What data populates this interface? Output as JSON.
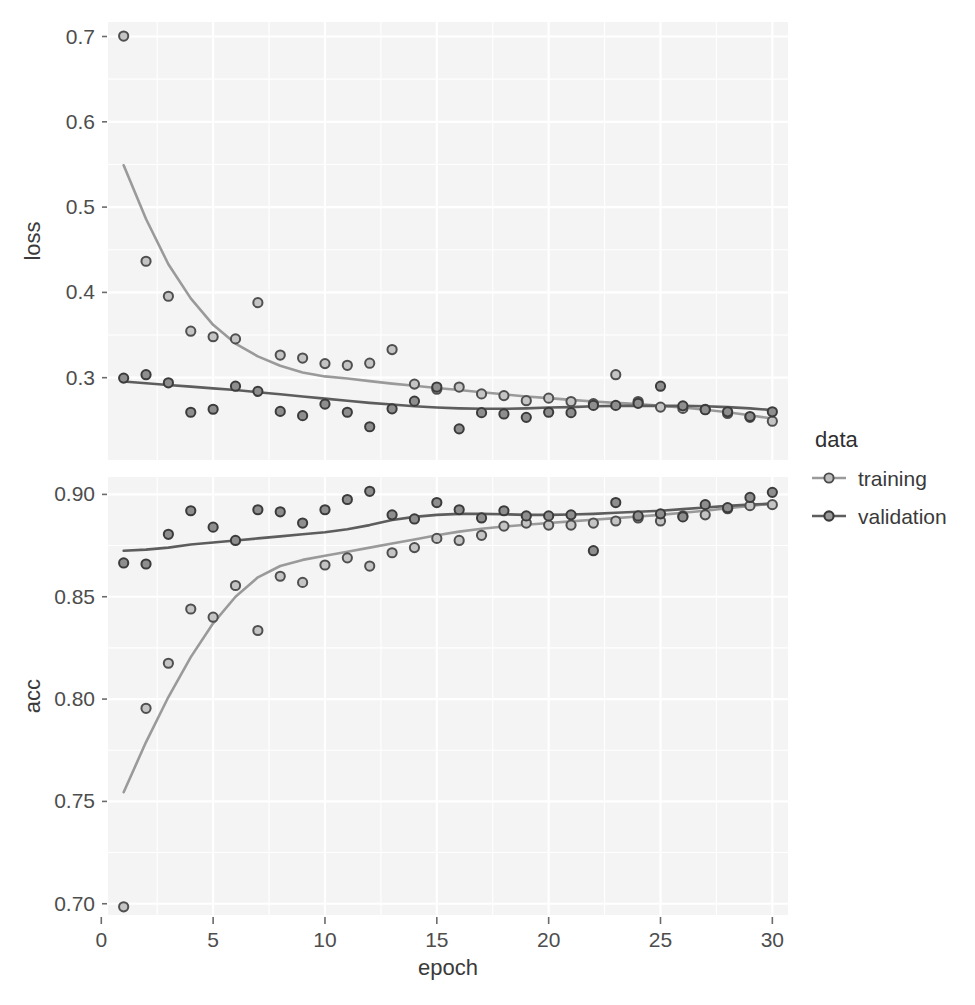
{
  "figure": {
    "background": "#ffffff",
    "panel_background": "#f4f4f4",
    "grid_color": "#ffffff",
    "width": 975,
    "height": 1005
  },
  "axes": {
    "x_title": "epoch",
    "x_ticks": [
      "0",
      "5",
      "10",
      "15",
      "20",
      "25",
      "30"
    ],
    "panels": [
      {
        "strip_label": "loss",
        "y_ticks": [
          "0.3",
          "0.4",
          "0.5",
          "0.6",
          "0.7"
        ]
      },
      {
        "strip_label": "acc",
        "y_ticks": [
          "0.70",
          "0.75",
          "0.80",
          "0.85",
          "0.90"
        ]
      }
    ]
  },
  "legend": {
    "title": "data",
    "position": "right",
    "items": [
      {
        "label": "training",
        "color": "#9a9a9a",
        "key_icon": "line-point-key-icon"
      },
      {
        "label": "validation",
        "color": "#5d5d5d",
        "key_icon": "line-point-key-icon"
      }
    ]
  },
  "chart_data": [
    {
      "type": "scatter",
      "id": "loss-panel",
      "title": "",
      "xlabel": "epoch",
      "ylabel": "loss",
      "xlim": [
        0.3,
        30.7
      ],
      "ylim": [
        0.2035,
        0.717
      ],
      "xticks": [
        0,
        5,
        10,
        15,
        20,
        25,
        30
      ],
      "yticks": [
        0.3,
        0.4,
        0.5,
        0.6,
        0.7
      ],
      "grid": true,
      "legend_position": "right",
      "x": [
        1,
        2,
        3,
        4,
        5,
        6,
        7,
        8,
        9,
        10,
        11,
        12,
        13,
        14,
        15,
        16,
        17,
        18,
        19,
        20,
        21,
        22,
        23,
        24,
        25,
        26,
        27,
        28,
        29,
        30
      ],
      "series": [
        {
          "name": "training",
          "color": "#9a9a9a",
          "has_smooth_line": true,
          "values": [
            0.7005,
            0.4365,
            0.3955,
            0.3545,
            0.348,
            0.3455,
            0.388,
            0.3265,
            0.323,
            0.3165,
            0.3145,
            0.317,
            0.333,
            0.2925,
            0.2865,
            0.289,
            0.281,
            0.279,
            0.273,
            0.276,
            0.272,
            0.2695,
            0.3035,
            0.272,
            0.2655,
            0.264,
            0.263,
            0.258,
            0.2535,
            0.249
          ],
          "smooth": [
            0.549,
            0.486,
            0.433,
            0.393,
            0.362,
            0.34,
            0.325,
            0.314,
            0.306,
            0.3015,
            0.299,
            0.296,
            0.293,
            0.2905,
            0.288,
            0.2855,
            0.283,
            0.2805,
            0.278,
            0.276,
            0.274,
            0.272,
            0.2705,
            0.269,
            0.267,
            0.265,
            0.2625,
            0.2595,
            0.256,
            0.252
          ]
        },
        {
          "name": "validation",
          "color": "#5d5d5d",
          "has_smooth_line": true,
          "values": [
            0.2995,
            0.3035,
            0.294,
            0.2595,
            0.263,
            0.29,
            0.284,
            0.2605,
            0.2555,
            0.269,
            0.2595,
            0.2425,
            0.2635,
            0.2725,
            0.289,
            0.24,
            0.259,
            0.2575,
            0.2535,
            0.2595,
            0.259,
            0.2675,
            0.2675,
            0.27,
            0.29,
            0.267,
            0.2625,
            0.26,
            0.2545,
            0.26
          ],
          "smooth": [
            0.2955,
            0.2935,
            0.2915,
            0.2895,
            0.2875,
            0.2855,
            0.283,
            0.2805,
            0.278,
            0.2755,
            0.273,
            0.2705,
            0.2685,
            0.2665,
            0.265,
            0.264,
            0.2635,
            0.2635,
            0.264,
            0.265,
            0.2655,
            0.2665,
            0.267,
            0.267,
            0.267,
            0.267,
            0.2665,
            0.2655,
            0.264,
            0.262
          ]
        }
      ]
    },
    {
      "type": "scatter",
      "id": "acc-panel",
      "title": "",
      "xlabel": "epoch",
      "ylabel": "acc",
      "xlim": [
        0.3,
        30.7
      ],
      "ylim": [
        0.6945,
        0.9085
      ],
      "xticks": [
        0,
        5,
        10,
        15,
        20,
        25,
        30
      ],
      "yticks": [
        0.7,
        0.75,
        0.8,
        0.85,
        0.9
      ],
      "grid": true,
      "legend_position": "right",
      "x": [
        1,
        2,
        3,
        4,
        5,
        6,
        7,
        8,
        9,
        10,
        11,
        12,
        13,
        14,
        15,
        16,
        17,
        18,
        19,
        20,
        21,
        22,
        23,
        24,
        25,
        26,
        27,
        28,
        29,
        30
      ],
      "series": [
        {
          "name": "training",
          "color": "#9a9a9a",
          "has_smooth_line": true,
          "values": [
            0.6985,
            0.7955,
            0.8175,
            0.844,
            0.84,
            0.8555,
            0.8335,
            0.86,
            0.857,
            0.8655,
            0.869,
            0.865,
            0.8715,
            0.874,
            0.8785,
            0.8775,
            0.88,
            0.8845,
            0.886,
            0.885,
            0.885,
            0.886,
            0.887,
            0.8885,
            0.887,
            0.8895,
            0.89,
            0.893,
            0.8945,
            0.895
          ],
          "smooth": [
            0.7545,
            0.779,
            0.801,
            0.8205,
            0.837,
            0.85,
            0.8595,
            0.865,
            0.868,
            0.87,
            0.872,
            0.874,
            0.876,
            0.878,
            0.88,
            0.8818,
            0.8832,
            0.8843,
            0.8852,
            0.886,
            0.8868,
            0.8876,
            0.8884,
            0.8892,
            0.89,
            0.891,
            0.892,
            0.8932,
            0.8944,
            0.8955
          ]
        },
        {
          "name": "validation",
          "color": "#5d5d5d",
          "has_smooth_line": true,
          "values": [
            0.8665,
            0.866,
            0.8805,
            0.892,
            0.884,
            0.8775,
            0.8925,
            0.8915,
            0.886,
            0.8925,
            0.8975,
            0.9015,
            0.89,
            0.888,
            0.896,
            0.8925,
            0.8885,
            0.892,
            0.8895,
            0.8895,
            0.89,
            0.8725,
            0.896,
            0.8895,
            0.8905,
            0.889,
            0.895,
            0.8935,
            0.8985,
            0.901
          ],
          "smooth": [
            0.8725,
            0.873,
            0.874,
            0.8755,
            0.8765,
            0.8775,
            0.8785,
            0.8795,
            0.8805,
            0.8815,
            0.883,
            0.885,
            0.8875,
            0.889,
            0.89,
            0.8905,
            0.8905,
            0.8903,
            0.89,
            0.89,
            0.8902,
            0.8905,
            0.891,
            0.8915,
            0.892,
            0.8928,
            0.8936,
            0.8944,
            0.895,
            0.8955
          ]
        }
      ]
    }
  ]
}
